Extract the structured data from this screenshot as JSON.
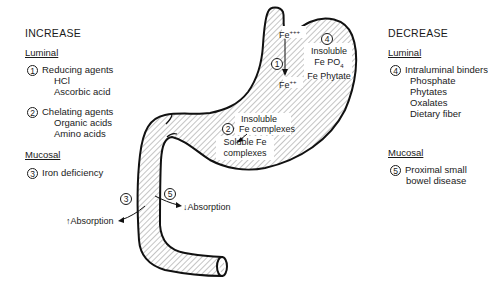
{
  "increase": {
    "heading": "INCREASE",
    "luminal_label": "Luminal",
    "items": [
      {
        "num": "1",
        "title": "Reducing agents",
        "subs": [
          "HCl",
          "Ascorbic acid"
        ]
      },
      {
        "num": "2",
        "title": "Chelating agents",
        "subs": [
          "Organic acids",
          "Amino acids"
        ]
      }
    ],
    "mucosal_label": "Mucosal",
    "mucosal_items": [
      {
        "num": "3",
        "title": "Iron deficiency"
      }
    ]
  },
  "decrease": {
    "heading": "DECREASE",
    "luminal_label": "Luminal",
    "items": [
      {
        "num": "4",
        "title": "Intraluminal binders",
        "subs": [
          "Phosphate",
          "Phytates",
          "Oxalates",
          "Dietary fiber"
        ]
      }
    ],
    "mucosal_label": "Mucosal",
    "mucosal_items": [
      {
        "num": "5",
        "title": "Proximal small",
        "title2": "bowel disease"
      }
    ]
  },
  "stomach": {
    "fe3": "Fe",
    "fe3_sup": "+++",
    "fe2": "Fe",
    "fe2_sup": "++",
    "marker1": "1",
    "marker4": "4",
    "insoluble_lines": [
      "Insoluble",
      "Fe PO",
      "Fe Phytate"
    ],
    "po4_sub": "4",
    "marker2": "2",
    "insoluble_complex": [
      "Insoluble",
      "Fe complexes"
    ],
    "soluble_complex": [
      "Soluble Fe",
      "complexes"
    ]
  },
  "duodenum": {
    "marker3": "3",
    "marker5": "5",
    "increase_absorption": "Absorption",
    "decrease_absorption": "Absorption",
    "up_arrow": "↑",
    "down_arrow": "↓"
  },
  "colors": {
    "ink": "#1a1a1a",
    "background": "#ffffff"
  }
}
